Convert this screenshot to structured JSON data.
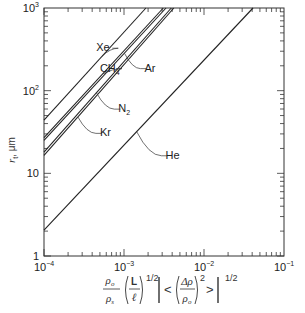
{
  "chart_data": {
    "type": "line",
    "title": "",
    "xscale": "log",
    "yscale": "log",
    "xlim": [
      0.0001,
      0.1
    ],
    "ylim": [
      1,
      1000
    ],
    "xticks": [
      {
        "value": 0.0001,
        "base": "10",
        "exp": "−4"
      },
      {
        "value": 0.001,
        "base": "10",
        "exp": "−3"
      },
      {
        "value": 0.01,
        "base": "10",
        "exp": "−2"
      },
      {
        "value": 0.1,
        "base": "10",
        "exp": "−1"
      }
    ],
    "yticks": [
      {
        "value": 1,
        "base": "1",
        "exp": ""
      },
      {
        "value": 10,
        "base": "10",
        "exp": ""
      },
      {
        "value": 100,
        "base": "10",
        "exp": "2"
      },
      {
        "value": 1000,
        "base": "10",
        "exp": "3"
      }
    ],
    "ylabel": {
      "main": "r",
      "sub": "t",
      "unit": ", μm"
    },
    "xlabel": {
      "rho_o": "ρ",
      "rho_o_sub": "o",
      "rho_s": "ρ",
      "rho_s_sub": "s",
      "L": "L",
      "ell": "ℓ",
      "half": "1/2",
      "delta_rho": "Δρ",
      "sq": "2",
      "lt": "<",
      "gt": ">"
    },
    "grid": false,
    "series": [
      {
        "name": "Xe",
        "sub": "",
        "points": [
          [
            0.0001,
            44
          ],
          [
            0.00188,
            1000
          ]
        ],
        "label_at": [
          0.00045,
          300
        ]
      },
      {
        "name": "CH",
        "sub": "4",
        "points": [
          [
            0.0001,
            27
          ],
          [
            0.0031,
            1000
          ]
        ],
        "label_at": [
          0.0005,
          170
        ]
      },
      {
        "name": "Ar",
        "sub": "",
        "points": [
          [
            0.0001,
            25
          ],
          [
            0.00335,
            1000
          ]
        ],
        "label_at": [
          0.0018,
          170
        ]
      },
      {
        "name": "N",
        "sub": "2",
        "points": [
          [
            0.0001,
            18
          ],
          [
            0.0039,
            1000
          ]
        ],
        "label_at": [
          0.00085,
          55
        ]
      },
      {
        "name": "Kr",
        "sub": "",
        "points": [
          [
            0.0001,
            16.5
          ],
          [
            0.0042,
            1000
          ]
        ],
        "label_at": [
          0.0005,
          28
        ]
      },
      {
        "name": "He",
        "sub": "",
        "points": [
          [
            0.0001,
            2.06
          ],
          [
            0.041,
            1000
          ]
        ],
        "label_at": [
          0.0033,
          15
        ]
      }
    ]
  }
}
